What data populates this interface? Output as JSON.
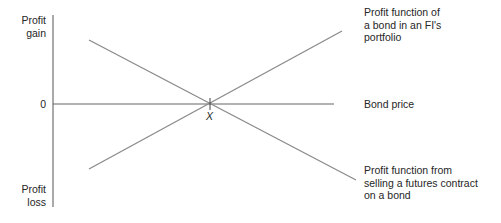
{
  "diagram": {
    "y_axis": {
      "top_label": "Profit\ngain",
      "zero_label": "0",
      "bottom_label": "Profit\nloss"
    },
    "x_axis": {
      "label": "Bond price"
    },
    "intersection_label": "X",
    "lines": [
      {
        "name": "bond-profit-function",
        "label": "Profit function of\na bond in an FI's\nportfolio",
        "direction": "increasing"
      },
      {
        "name": "short-futures-profit-function",
        "label": "Profit function from\nselling a futures contract\non a bond",
        "direction": "decreasing"
      }
    ],
    "colors": {
      "lines": "#8a8a8a",
      "axes": "#555555",
      "text": "#262626"
    }
  }
}
